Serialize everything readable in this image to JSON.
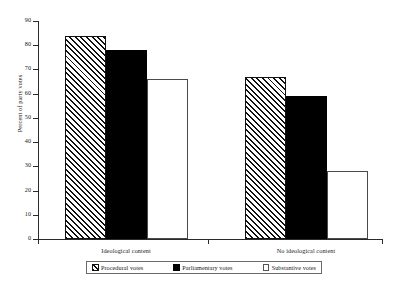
{
  "chart_data": {
    "type": "bar",
    "title": "",
    "subtitle": "",
    "xlabel": "",
    "ylabel": "Percent of party votes",
    "ylim": [
      0,
      90
    ],
    "ytick_step": 10,
    "yticks": [
      0,
      10,
      20,
      30,
      40,
      50,
      60,
      70,
      80,
      90
    ],
    "grid": false,
    "legend_position": "bottom",
    "categories": [
      "Ideological content",
      "No ideological content"
    ],
    "series": [
      {
        "name": "Procedural votes",
        "values": [
          84,
          67
        ],
        "fill": "diagonal-hatch",
        "color": "#111111"
      },
      {
        "name": "Parliamentary votes",
        "values": [
          78,
          59
        ],
        "fill": "solid",
        "color": "#000000"
      },
      {
        "name": "Substantive votes",
        "values": [
          66,
          28
        ],
        "fill": "outline",
        "color": "#ffffff"
      }
    ]
  },
  "legend": {
    "items": [
      {
        "label": "Procedural votes",
        "swatch": "hatched-swatch-icon"
      },
      {
        "label": "Parliamentary votes",
        "swatch": "black-swatch-icon"
      },
      {
        "label": "Substantive votes",
        "swatch": "white-swatch-icon"
      }
    ]
  }
}
